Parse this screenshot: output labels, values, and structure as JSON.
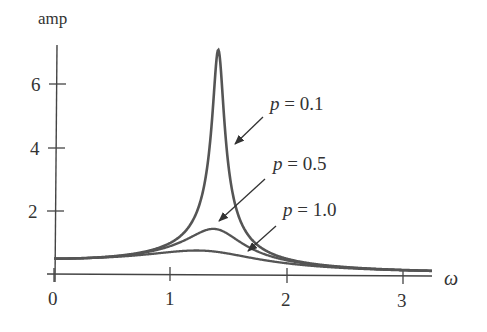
{
  "chart_data": {
    "type": "line",
    "title": "",
    "xlabel": "ω",
    "ylabel": "amp",
    "xlim": [
      0,
      3.25
    ],
    "ylim": [
      0,
      7.3
    ],
    "grid": false,
    "legend": "none (inline annotations with arrows)",
    "x_ticks": [
      "0",
      "1",
      "2",
      "3"
    ],
    "y_ticks": [
      "2",
      "4",
      "6"
    ],
    "series": [
      {
        "name": "p = 0.1",
        "p": 0.1,
        "peak": {
          "x": 1.41,
          "y": 7.0
        },
        "start": {
          "x": 0,
          "y": 0.5
        },
        "end": {
          "x": 3.25,
          "y": 0.12
        }
      },
      {
        "name": "p = 0.5",
        "p": 0.5,
        "peak": {
          "x": 1.38,
          "y": 1.37
        },
        "start": {
          "x": 0,
          "y": 0.5
        },
        "end": {
          "x": 3.25,
          "y": 0.11
        }
      },
      {
        "name": "p = 1.0",
        "p": 1.0,
        "peak": {
          "x": 1.22,
          "y": 0.76
        },
        "start": {
          "x": 0,
          "y": 0.5
        },
        "end": {
          "x": 3.25,
          "y": 0.1
        }
      }
    ],
    "model": "amp(ω) = 1 / sqrt((2 − ω²)² + (p·ω)²)",
    "annotations": [
      {
        "text": "p = 0.1",
        "points_to_series": "p = 0.1"
      },
      {
        "text": "p = 0.5",
        "points_to_series": "p = 0.5"
      },
      {
        "text": "p = 1.0",
        "points_to_series": "p = 1.0"
      }
    ]
  },
  "labels": {
    "ylabel": "amp",
    "xlabel": "ω",
    "xticks": [
      "0",
      "1",
      "2",
      "3"
    ],
    "yticks": [
      "6",
      "4",
      "2"
    ],
    "ann": [
      {
        "var": "p",
        "rest": " = 0.1"
      },
      {
        "var": "p",
        "rest": " = 0.5"
      },
      {
        "var": "p",
        "rest": " = 1.0"
      }
    ]
  },
  "colors": {
    "curve": "#555555",
    "axis": "#444444",
    "text": "#333333"
  }
}
